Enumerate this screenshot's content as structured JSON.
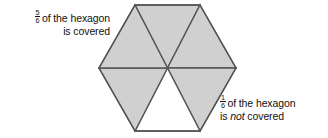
{
  "page": {
    "background_color": "#ffffff",
    "text_color": "#111111",
    "width": 328,
    "height": 138
  },
  "caption_left": {
    "fraction_numerator": "5",
    "fraction_denominator": "6",
    "line1_rest": "of the hexagon",
    "line2": "is covered",
    "align": "right"
  },
  "caption_right": {
    "fraction_numerator": "1",
    "fraction_denominator": "6",
    "line1_rest": "of the hexagon",
    "line2_before": "is",
    "line2_emphasis": "not",
    "line2_after": "covered",
    "align": "left"
  },
  "figure": {
    "shape": "hexagon",
    "orientation": "flat-top",
    "total_parts": 6,
    "shaded_parts": 5,
    "unshaded_parts": 1,
    "fill_color": "#d0d0d0",
    "empty_color": "#ffffff",
    "stroke_color": "#555555",
    "stroke_width": 1.4,
    "center": {
      "x": 167.5,
      "y": 68
    },
    "vertices": [
      {
        "x": 135,
        "y": 5
      },
      {
        "x": 200,
        "y": 5
      },
      {
        "x": 236,
        "y": 68
      },
      {
        "x": 200,
        "y": 131
      },
      {
        "x": 135,
        "y": 131
      },
      {
        "x": 99,
        "y": 68
      }
    ],
    "triangles": [
      {
        "name": "top",
        "filled": true
      },
      {
        "name": "upper-right",
        "filled": true
      },
      {
        "name": "lower-right",
        "filled": true
      },
      {
        "name": "bottom",
        "filled": false
      },
      {
        "name": "lower-left",
        "filled": true
      },
      {
        "name": "upper-left",
        "filled": true
      }
    ]
  }
}
